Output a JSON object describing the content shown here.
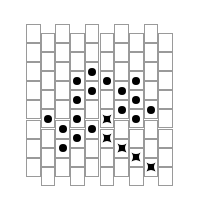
{
  "puzzle": {
    "columns": 10,
    "rows_per_column": 8,
    "col_left": [
      26,
      40.7,
      55.4,
      70.1,
      84.8,
      99.5,
      114.2,
      128.9,
      143.6,
      158.3
    ],
    "col_width": 14.7,
    "cell_height": 19.1,
    "odd_top": 24,
    "even_top": 33,
    "grid_color": "#9a9a9a",
    "marker_color": "#000000",
    "dots": [
      [
        1,
        4
      ],
      [
        2,
        5
      ],
      [
        2,
        6
      ],
      [
        3,
        2
      ],
      [
        3,
        3
      ],
      [
        3,
        4
      ],
      [
        3,
        5
      ],
      [
        4,
        2
      ],
      [
        4,
        3
      ],
      [
        4,
        5
      ],
      [
        5,
        2
      ],
      [
        6,
        3
      ],
      [
        6,
        4
      ],
      [
        7,
        2
      ],
      [
        7,
        3
      ],
      [
        7,
        4
      ],
      [
        8,
        4
      ]
    ],
    "stars": [
      [
        5,
        4
      ],
      [
        5,
        5
      ],
      [
        6,
        6
      ],
      [
        7,
        6
      ],
      [
        8,
        7
      ]
    ],
    "icons": {
      "dot": "filled-circle",
      "star": "four-point-star"
    }
  }
}
